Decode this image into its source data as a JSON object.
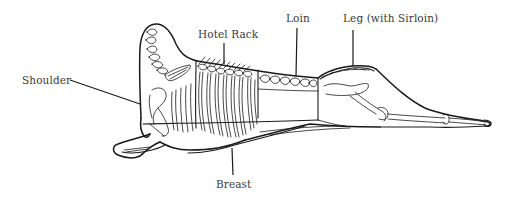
{
  "diagram": {
    "labels": {
      "shoulder": "Shoulder",
      "hotel_rack": "Hotel Rack",
      "loin": "Loin",
      "leg": "Leg (with Sirloin)",
      "breast": "Breast"
    },
    "colors": {
      "background": "#ffffff",
      "line": "#1a1a1a",
      "label_text": "#3a3a3a"
    }
  }
}
